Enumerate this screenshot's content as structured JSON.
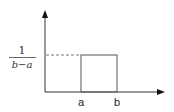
{
  "diagram": {
    "y_label": {
      "numerator": "1",
      "denominator": "b−a"
    },
    "x_labels": [
      "a",
      "b"
    ],
    "colors": {
      "axis": "#111111",
      "box": "#555555",
      "dashed": "#777777",
      "text": "#222222"
    }
  }
}
